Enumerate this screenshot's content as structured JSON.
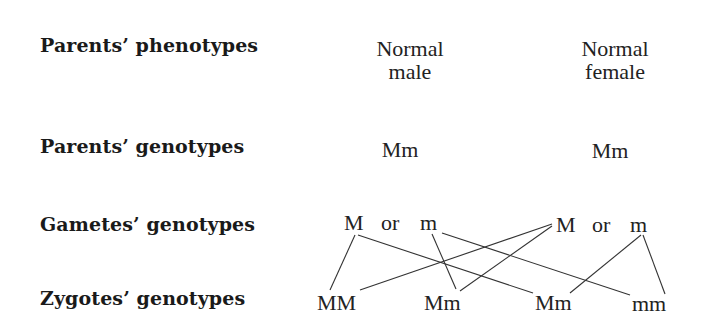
{
  "rows": [
    {
      "label": "Parents’ phenotypes"
    },
    {
      "label": "Parents’ genotypes"
    },
    {
      "label": "Gametes’ genotypes"
    },
    {
      "label": "Zygotes’ genotypes"
    }
  ],
  "phenotypes": {
    "male": {
      "line1": "Normal",
      "line2": "male"
    },
    "female": {
      "line1": "Normal",
      "line2": "female"
    }
  },
  "genotypes": {
    "male": "Mm",
    "female": "Mm"
  },
  "gametes": {
    "male": {
      "a": "M",
      "or": "or",
      "b": "m"
    },
    "female": {
      "a": "M",
      "or": "or",
      "b": "m"
    }
  },
  "zygotes": [
    "MM",
    "Mm",
    "Mm",
    "mm"
  ]
}
